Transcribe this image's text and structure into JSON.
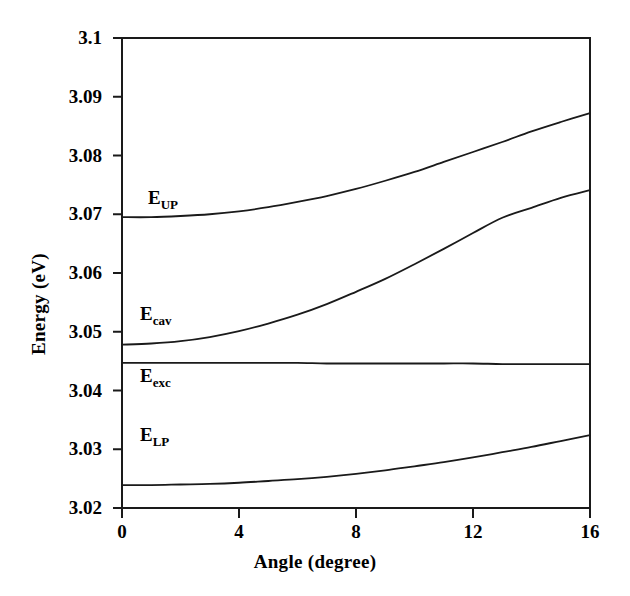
{
  "chart_data": {
    "type": "line",
    "title": "",
    "xlabel": "Angle (degree)",
    "ylabel": "Energy (eV)",
    "xlim": [
      0,
      16
    ],
    "ylim": [
      3.02,
      3.1
    ],
    "xticks": [
      "0",
      "4",
      "8",
      "12",
      "16"
    ],
    "xtick_values": [
      0,
      4,
      8,
      12,
      16
    ],
    "yticks": [
      "3.02",
      "3.03",
      "3.04",
      "3.05",
      "3.06",
      "3.07",
      "3.08",
      "3.09",
      "3.1"
    ],
    "ytick_values": [
      3.02,
      3.03,
      3.04,
      3.05,
      3.06,
      3.07,
      3.08,
      3.09,
      3.1
    ],
    "grid": false,
    "legend": "inline-curve-labels",
    "line_color": "#1a1a1a",
    "x": [
      0,
      1,
      2,
      3,
      4,
      5,
      6,
      7,
      8,
      9,
      10,
      11,
      12,
      13,
      14,
      15,
      16
    ],
    "series": [
      {
        "name": "E_UP",
        "label": "E",
        "sublabel": "UP",
        "values": [
          3.0695,
          3.0695,
          3.0697,
          3.07,
          3.0705,
          3.0712,
          3.0721,
          3.0731,
          3.0743,
          3.0757,
          3.0772,
          3.0789,
          3.0806,
          3.0823,
          3.0841,
          3.0857,
          3.0872
        ]
      },
      {
        "name": "E_cav",
        "label": "E",
        "sublabel": "cav",
        "values": [
          3.0478,
          3.048,
          3.0484,
          3.0491,
          3.0501,
          3.0514,
          3.0529,
          3.0547,
          3.0568,
          3.059,
          3.0615,
          3.0641,
          3.0668,
          3.0694,
          3.0711,
          3.0728,
          3.0741
        ]
      },
      {
        "name": "E_exc",
        "label": "E",
        "sublabel": "exc",
        "values": [
          3.0447,
          3.0447,
          3.0447,
          3.0447,
          3.0447,
          3.0447,
          3.0447,
          3.0446,
          3.0446,
          3.0446,
          3.0446,
          3.0446,
          3.0446,
          3.0445,
          3.0445,
          3.0445,
          3.0445
        ]
      },
      {
        "name": "E_LP",
        "label": "E",
        "sublabel": "LP",
        "values": [
          3.0239,
          3.0239,
          3.024,
          3.0241,
          3.0243,
          3.0246,
          3.0249,
          3.0253,
          3.0258,
          3.0264,
          3.0271,
          3.0278,
          3.0286,
          3.0295,
          3.0304,
          3.0314,
          3.0324
        ]
      }
    ]
  },
  "axes": {
    "ylabel": "Energy (eV)",
    "xlabel": "Angle (degree)"
  },
  "labels": {
    "up": {
      "base": "E",
      "sub": "UP"
    },
    "cav": {
      "base": "E",
      "sub": "cav"
    },
    "exc": {
      "base": "E",
      "sub": "exc"
    },
    "lp": {
      "base": "E",
      "sub": "LP"
    }
  },
  "yticks": {
    "t0": "3.02",
    "t1": "3.03",
    "t2": "3.04",
    "t3": "3.05",
    "t4": "3.06",
    "t5": "3.07",
    "t6": "3.08",
    "t7": "3.09",
    "t8": "3.1"
  },
  "xticks": {
    "t0": "0",
    "t1": "4",
    "t2": "8",
    "t3": "12",
    "t4": "16"
  }
}
